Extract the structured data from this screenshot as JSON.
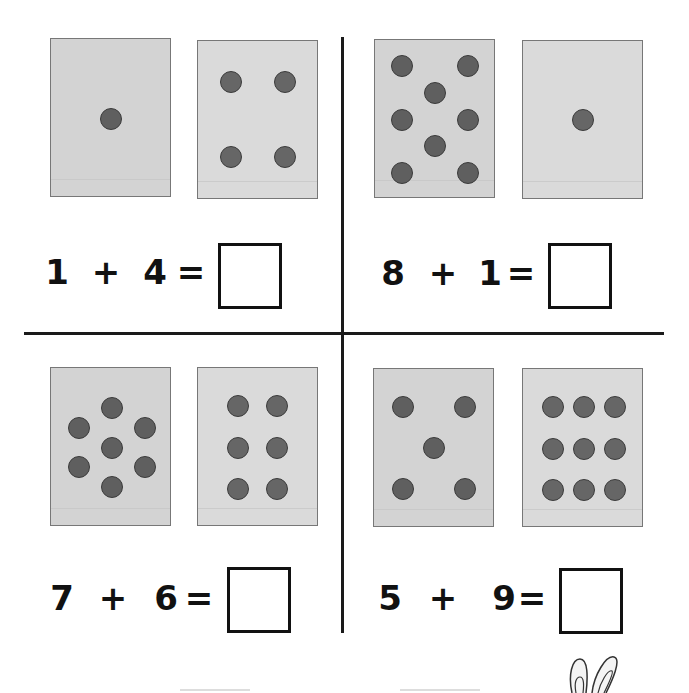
{
  "worksheet": {
    "problems": [
      {
        "id": "top-left",
        "card_a": {
          "count": 1,
          "left": 50,
          "top": 38,
          "dots": [
            [
              60,
              80
            ]
          ]
        },
        "card_b": {
          "count": 4,
          "left": 197,
          "top": 40,
          "dots": [
            [
              33,
              41
            ],
            [
              87,
              41
            ],
            [
              33,
              116
            ],
            [
              87,
              116
            ]
          ]
        },
        "addend_1": "1",
        "operator": "+",
        "addend_2": "4",
        "equals": "=",
        "answer": "",
        "eq_top": 252,
        "glyph_x": [
          57,
          106,
          155,
          191
        ],
        "box": {
          "left": 218,
          "top": 243
        }
      },
      {
        "id": "top-right",
        "card_a": {
          "count": 8,
          "left": 374,
          "top": 39,
          "dots": [
            [
              27,
              26
            ],
            [
              93,
              26
            ],
            [
              60,
              53
            ],
            [
              27,
              80
            ],
            [
              93,
              80
            ],
            [
              60,
              106
            ],
            [
              27,
              133
            ],
            [
              93,
              133
            ]
          ]
        },
        "card_b": {
          "count": 1,
          "left": 522,
          "top": 40,
          "dots": [
            [
              60,
              79
            ]
          ]
        },
        "addend_1": "8",
        "operator": "+",
        "addend_2": "1",
        "equals": "=",
        "answer": "",
        "eq_top": 253,
        "glyph_x": [
          393,
          443,
          490,
          521
        ],
        "box": {
          "left": 548,
          "top": 243
        }
      },
      {
        "id": "bottom-left",
        "card_a": {
          "count": 7,
          "left": 50,
          "top": 367,
          "dots": [
            [
              61,
              40
            ],
            [
              28,
              60
            ],
            [
              94,
              60
            ],
            [
              61,
              80
            ],
            [
              28,
              99
            ],
            [
              94,
              99
            ],
            [
              61,
              119
            ]
          ]
        },
        "card_b": {
          "count": 6,
          "left": 197,
          "top": 367,
          "dots": [
            [
              40,
              38
            ],
            [
              79,
              38
            ],
            [
              40,
              80
            ],
            [
              79,
              80
            ],
            [
              40,
              121
            ],
            [
              79,
              121
            ]
          ]
        },
        "addend_1": "7",
        "operator": "+",
        "addend_2": "6",
        "equals": "=",
        "answer": "",
        "eq_top": 578,
        "glyph_x": [
          62,
          113,
          166,
          199
        ],
        "box": {
          "left": 227,
          "top": 567
        }
      },
      {
        "id": "bottom-right",
        "card_a": {
          "count": 5,
          "left": 373,
          "top": 368,
          "dots": [
            [
              29,
              38
            ],
            [
              91,
              38
            ],
            [
              60,
              79
            ],
            [
              29,
              120
            ],
            [
              91,
              120
            ]
          ]
        },
        "card_b": {
          "count": 9,
          "left": 522,
          "top": 368,
          "dots": [
            [
              30,
              38
            ],
            [
              61,
              38
            ],
            [
              92,
              38
            ],
            [
              30,
              80
            ],
            [
              61,
              80
            ],
            [
              92,
              80
            ],
            [
              30,
              121
            ],
            [
              61,
              121
            ],
            [
              92,
              121
            ]
          ]
        },
        "addend_1": "5",
        "operator": "+",
        "addend_2": "9",
        "equals": "=",
        "answer": "",
        "eq_top": 578,
        "glyph_x": [
          390,
          443,
          504,
          532
        ],
        "box": {
          "left": 559,
          "top": 568
        }
      }
    ]
  },
  "colors": {
    "card_a_bg": "#d3d3d3",
    "card_b_bg": "#dadada",
    "dot_fill": "#5f5f5f",
    "dot_border": "#3b3b3b",
    "ink": "#111111"
  },
  "decorations": {
    "bunny_ears": "bunny-ears-icon"
  }
}
